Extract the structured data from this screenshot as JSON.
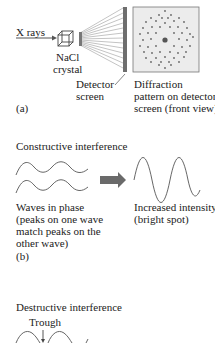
{
  "panel_a": {
    "xray_label": "X rays",
    "crystal_label_1": "NaCl",
    "crystal_label_2": "crystal",
    "detector_label_1": "Detector",
    "detector_label_2": "screen",
    "pattern_label_1": "Diffraction",
    "pattern_label_2": "pattern on detector",
    "pattern_label_3": "screen (front view)",
    "tag": "(a)"
  },
  "panel_b": {
    "title": "Constructive interference",
    "left_caption_1": "Waves in phase",
    "left_caption_2": "(peaks on one wave",
    "left_caption_3": "match peaks on the",
    "left_caption_4": "other wave)",
    "right_caption_1": "Increased intensity",
    "right_caption_2": "(bright spot)",
    "tag": "(b)"
  },
  "panel_c": {
    "title": "Destructive interference",
    "trough_label": "Trough"
  },
  "colors": {
    "line": "#555555",
    "detector": "#6e6e6e",
    "arrow": "#6a6a6a",
    "pattern_bg": "#ececec",
    "dot": "#5a5a5a"
  }
}
